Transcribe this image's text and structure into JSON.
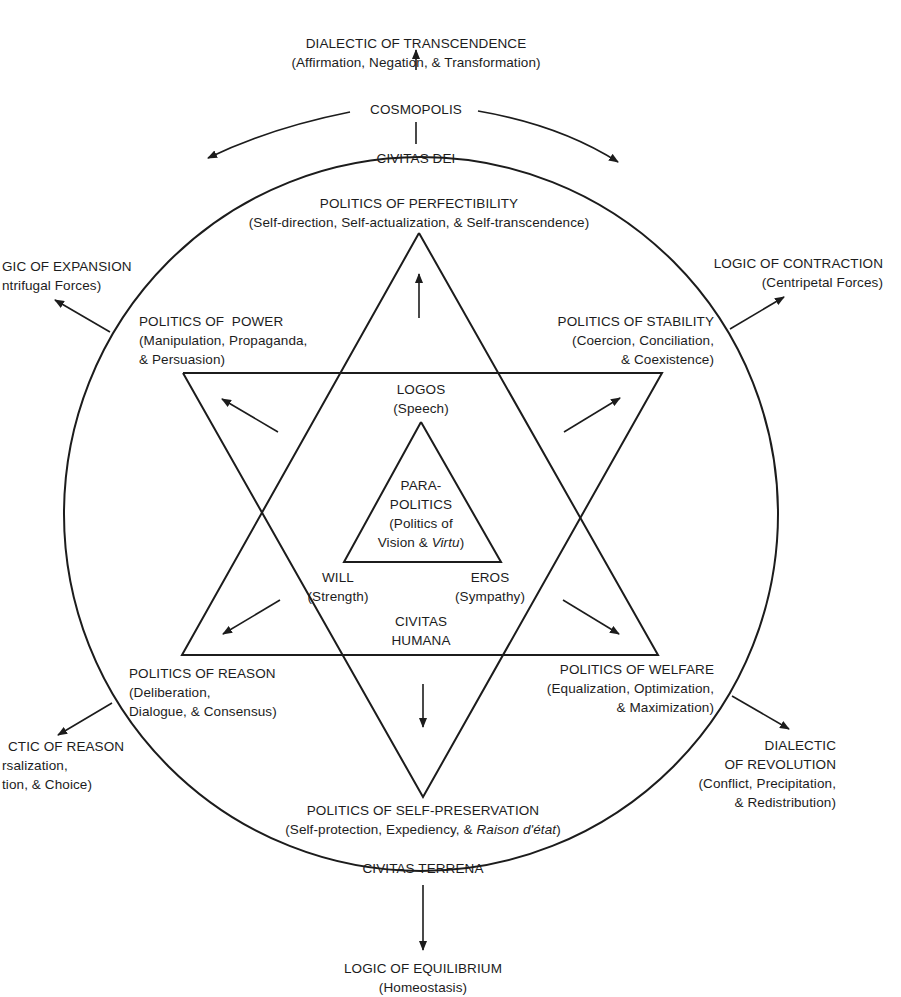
{
  "diagram": {
    "title_fragment": "",
    "outer_nodes": {
      "top": {
        "title": "DIALECTIC OF TRANSCENDENCE",
        "subtitle": "(Affirmation, Negation, & Transformation)"
      },
      "cosmopolis": "COSMOPOLIS",
      "upper_left": {
        "title": "GIC OF EXPANSION",
        "subtitle": "ntrifugal Forces)"
      },
      "upper_right": {
        "title": "LOGIC OF CONTRACTION",
        "subtitle": "(Centripetal Forces)"
      },
      "lower_left": {
        "title": "CTIC OF REASON",
        "line2": "rsalization,",
        "line3": "tion, & Choice)"
      },
      "lower_right": {
        "title": "DIALECTIC",
        "line2": "OF REVOLUTION",
        "line3": "(Conflict, Precipitation,",
        "line4": "& Redistribution)"
      },
      "bottom": {
        "title": "LOGIC OF EQUILIBRIUM",
        "subtitle": "(Homeostasis)"
      }
    },
    "circle_labels": {
      "top": "CIVITAS DEI",
      "bottom": "CIVITAS TERRENA"
    },
    "star_points": {
      "top": {
        "title": "POLITICS OF PERFECTIBILITY",
        "subtitle": "(Self-direction, Self-actualization, & Self-transcendence)"
      },
      "upper_left": {
        "title": "POLITICS OF  POWER",
        "line2": "(Manipulation, Propaganda,",
        "line3": "& Persuasion)"
      },
      "upper_right": {
        "title": "POLITICS OF STABILITY",
        "line2": "(Coercion, Conciliation,",
        "line3": "& Coexistence)"
      },
      "lower_left": {
        "title": "POLITICS OF REASON",
        "line2": "(Deliberation,",
        "line3": "Dialogue, & Consensus)"
      },
      "lower_right": {
        "title": "POLITICS OF WELFARE",
        "line2": "(Equalization, Optimization,",
        "line3": "& Maximization)"
      },
      "bottom": {
        "title": "POLITICS OF SELF-PRESERVATION",
        "subtitle_plain": "(Self-protection, Expediency, & ",
        "subtitle_italic": "Raison d'état",
        "subtitle_end": ")"
      }
    },
    "inner": {
      "logos": {
        "title": "LOGOS",
        "subtitle": "(Speech)"
      },
      "will": {
        "title": "WILL",
        "subtitle": "(Strength)"
      },
      "eros": {
        "title": "EROS",
        "subtitle": "(Sympathy)"
      },
      "center": {
        "line1": "PARA-",
        "line2": "POLITICS",
        "line3": "(Politics of",
        "line4_plain": "Vision & ",
        "line4_italic": "Virtu",
        "line4_end": ")"
      },
      "civitas_humana": {
        "line1": "CIVITAS",
        "line2": "HUMANA"
      }
    },
    "colors": {
      "ink": "#1c1c1c",
      "background": "#ffffff"
    }
  }
}
